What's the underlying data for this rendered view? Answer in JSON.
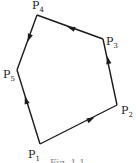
{
  "diagram": {
    "type": "polygon-traversal",
    "vertices": [
      {
        "id": "P1",
        "name": "P",
        "sub": "1",
        "x": 40,
        "y": 144,
        "lx": 28,
        "ly": 158
      },
      {
        "id": "P2",
        "name": "P",
        "sub": "2",
        "x": 117,
        "y": 105,
        "lx": 121,
        "ly": 114
      },
      {
        "id": "P3",
        "name": "P",
        "sub": "3",
        "x": 103,
        "y": 39,
        "lx": 106,
        "ly": 45
      },
      {
        "id": "P4",
        "name": "P",
        "sub": "4",
        "x": 37,
        "y": 15,
        "lx": 32,
        "ly": 9
      },
      {
        "id": "P5",
        "name": "P",
        "sub": "5",
        "x": 17,
        "y": 70,
        "lx": 3,
        "ly": 78
      }
    ],
    "edges": [
      {
        "from": "P1",
        "to": "P2",
        "arrow_direction": "toward P2"
      },
      {
        "from": "P2",
        "to": "P3",
        "arrow_direction": "toward P3"
      },
      {
        "from": "P3",
        "to": "P4",
        "arrow_direction": "toward P4"
      },
      {
        "from": "P4",
        "to": "P5",
        "arrow_direction": "toward P5"
      },
      {
        "from": "P1",
        "to": "P5",
        "arrow_direction": "toward P5"
      }
    ],
    "caption": "Fig. 1.1"
  }
}
